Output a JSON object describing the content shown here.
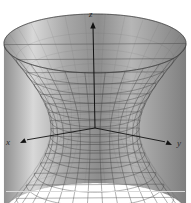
{
  "figure": {
    "name": "hyperboloid-of-one-sheet",
    "caption": "",
    "background_color": "#ffffff",
    "axes": {
      "z": {
        "label": "z",
        "direction": "up",
        "tip_x": 93,
        "tip_y": 22
      },
      "x": {
        "label": "x",
        "direction": "down-left",
        "tip_x": 20,
        "tip_y": 143
      },
      "y": {
        "label": "y",
        "direction": "down-right",
        "tip_x": 172,
        "tip_y": 145
      }
    },
    "colors": {
      "axis": "#1a1a1a",
      "mesh_line": "#4a4a4a",
      "surface_light": "#f2f2f2",
      "surface_mid": "#b4b4b4",
      "surface_dark": "#8c8c8c",
      "rule": "#d9d9d9"
    }
  },
  "chart_data": {
    "type": "surface",
    "title": "",
    "subtitle": "",
    "xlabel": "x",
    "ylabel": "y",
    "zlabel": "z",
    "surface_equation": "x^2 + y^2 - z^2 = 1",
    "surface_name": "Hyperboloid of one sheet",
    "parametrization": "x = a*cosh(v)*cos(u), y = a*cosh(v)*sin(u), z = c*sinh(v)",
    "waist_radius": 1.0,
    "u_range": [
      0,
      6.2832
    ],
    "v_range": [
      -1.35,
      1.35
    ],
    "u_divisions": 28,
    "v_divisions": 16,
    "grid": true,
    "legend": "none",
    "projection": {
      "type": "oblique-orthographic",
      "center_x": 95,
      "center_y": 128,
      "scale_x": 68,
      "scale_y": 22,
      "scale_z": 47
    },
    "annotations": [
      {
        "text": "z",
        "x": 93,
        "y": 14
      },
      {
        "text": "x",
        "x": 10,
        "y": 143
      },
      {
        "text": "y",
        "x": 179,
        "y": 145
      }
    ]
  }
}
